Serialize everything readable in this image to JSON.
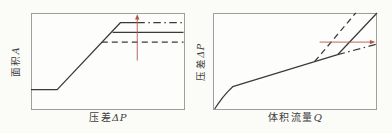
{
  "figure": {
    "background": "#fbfbf8",
    "line_color": "#3a3a3a",
    "border_color": "#9e9e9e",
    "arrow_color": "#b2574e"
  },
  "chart_data": [
    {
      "type": "line",
      "title": "",
      "xlabel": "压差ΔP",
      "ylabel": "面积A",
      "xlabel_cn": "压差",
      "xlabel_var": "ΔP",
      "ylabel_cn": "面积",
      "ylabel_var": "A",
      "xlim": [
        0,
        100
      ],
      "ylim": [
        0,
        100
      ],
      "grid": false,
      "legend_position": "none",
      "series": [
        {
          "name": "area-curve-solid",
          "style": "solid",
          "points": [
            [
              0,
              21
            ],
            [
              17,
              21
            ],
            [
              58,
              90
            ],
            [
              69,
              90
            ]
          ]
        },
        {
          "name": "area-plateau-dashdot",
          "style": "dashdot",
          "points": [
            [
              69,
              90
            ],
            [
              99,
              90
            ]
          ]
        },
        {
          "name": "area-plateau-solid",
          "style": "solid",
          "points": [
            [
              53,
              80
            ],
            [
              99,
              80
            ]
          ]
        },
        {
          "name": "area-plateau-dashed",
          "style": "dashed",
          "points": [
            [
              46,
              70
            ],
            [
              99,
              70
            ]
          ]
        }
      ],
      "annotations": [
        {
          "name": "increase-arrow",
          "type": "arrow",
          "from": [
            69,
            51
          ],
          "to": [
            69,
            99
          ]
        }
      ]
    },
    {
      "type": "line",
      "title": "",
      "xlabel": "体积流量Q",
      "ylabel": "压差ΔP",
      "xlabel_cn": "体积流量",
      "xlabel_var": "Q",
      "ylabel_cn": "压差",
      "ylabel_var": "ΔP",
      "xlim": [
        0,
        100
      ],
      "ylim": [
        0,
        100
      ],
      "grid": false,
      "legend_position": "none",
      "series": [
        {
          "name": "dp-curve-solid",
          "style": "solid",
          "points": [
            [
              1,
              1
            ],
            [
              3,
              6
            ],
            [
              6,
              13
            ],
            [
              9,
              19
            ],
            [
              12,
              24
            ],
            [
              76,
              57
            ],
            [
              100,
              100
            ]
          ]
        },
        {
          "name": "dp-branch-dashed",
          "style": "dashed",
          "points": [
            [
              62,
              50
            ],
            [
              87,
              100
            ]
          ]
        },
        {
          "name": "dp-branch-dashdot",
          "style": "dashdot",
          "points": [
            [
              76,
              57
            ],
            [
              100,
              68
            ]
          ]
        }
      ],
      "annotations": [
        {
          "name": "flow-arrow",
          "type": "arrow",
          "from": [
            65,
            70
          ],
          "to": [
            99,
            70
          ]
        }
      ]
    }
  ]
}
